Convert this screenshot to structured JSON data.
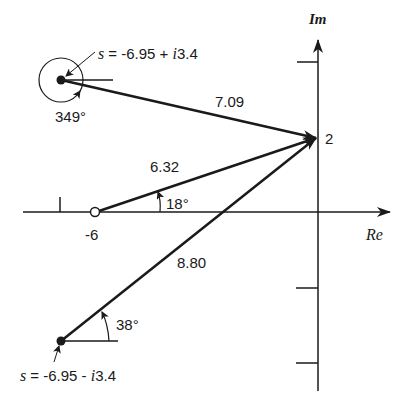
{
  "diagram": {
    "axes": {
      "real_label": "Re",
      "imag_label": "Im",
      "real_tick_label": "-6",
      "imag_point_label": "2"
    },
    "poles": [
      {
        "label_prefix": "s = -6.95 + ",
        "label_i": "i",
        "label_suffix": "3.4",
        "re": -6.95,
        "im": 3.4,
        "angle_label": "349°",
        "vector_length_label": "7.09"
      },
      {
        "label_prefix": "s = -6.95 - ",
        "label_i": "i",
        "label_suffix": "3.4",
        "re": -6.95,
        "im": -3.4,
        "angle_label": "38°",
        "vector_length_label": "8.80"
      }
    ],
    "zero": {
      "re": -6,
      "im": 0,
      "angle_label": "18°",
      "vector_length_label": "6.32"
    },
    "test_point": {
      "re": 0,
      "im": 2,
      "label": "2"
    },
    "colors": {
      "ink": "#1a1a1a",
      "background": "#ffffff"
    }
  }
}
